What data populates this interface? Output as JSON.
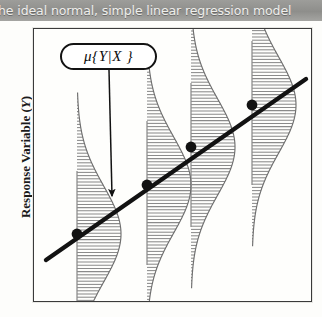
{
  "caption": {
    "text": "he ideal normal, simple linear regression model"
  },
  "axes": {
    "y_label_main": "Response Variable (",
    "y_label_var": "Y",
    "y_label_close": ")"
  },
  "callout": {
    "label": "μ{Y|X }"
  },
  "colors": {
    "ink": "#121212",
    "frame": "#3a3a3a",
    "hatch": "#8a8a8a",
    "curve_outline": "#6f6f6f",
    "caption_band": "#8e8e8b",
    "caption_text": "#efefec",
    "page": "#fdfdfb"
  },
  "chart_data": {
    "type": "line",
    "xlabel": "",
    "ylabel": "Response Variable (Y)",
    "grid": false,
    "legend": "none",
    "annotations": [
      {
        "text": "μ{Y|X }",
        "shape": "rounded-rectangle-callout",
        "anchor_x": 75,
        "anchor_y": 28,
        "arrow_to_x": 78,
        "arrow_to_y": 167
      }
    ],
    "regression_line": {
      "x_start": 12,
      "y_start": 231,
      "x_end": 272,
      "y_end": 50
    },
    "mean_points": [
      {
        "x": 43,
        "y": 205
      },
      {
        "x": 113,
        "y": 156
      },
      {
        "x": 157,
        "y": 118
      },
      {
        "x": 218,
        "y": 76
      }
    ],
    "distributions": [
      {
        "center_x": 43,
        "mean_y": 205,
        "sd_px": 48,
        "max_width": 44,
        "stem_top": 142,
        "stem_bottom": 272
      },
      {
        "center_x": 113,
        "mean_y": 156,
        "sd_px": 48,
        "max_width": 44,
        "stem_top": 92,
        "stem_bottom": 236
      },
      {
        "center_x": 157,
        "mean_y": 118,
        "sd_px": 48,
        "max_width": 44,
        "stem_top": 54,
        "stem_bottom": 198
      },
      {
        "center_x": 218,
        "mean_y": 76,
        "sd_px": 48,
        "max_width": 44,
        "stem_top": 12,
        "stem_bottom": 156
      }
    ],
    "hatch_spacing_px": 3.2
  }
}
